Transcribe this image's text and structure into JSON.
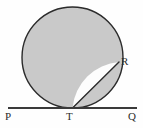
{
  "figure": {
    "background_color": "#fefefe",
    "stroke_color": "#2b2b2b",
    "shaded_fill_color": "#c9c9c9",
    "unshaded_fill_color": "#fdfdfd",
    "labels": {
      "P": "P",
      "T": "T",
      "Q": "Q",
      "R": "R"
    }
  },
  "chart_data": {
    "type": "diagram",
    "elements": [
      {
        "name": "circle",
        "kind": "circle",
        "center_x": 72.5,
        "center_y": 57.5,
        "radius": 50.5,
        "fill": "#c9c9c9",
        "stroke": "#2b2b2b",
        "stroke_width": 1.4
      },
      {
        "name": "tangent-line-PQ",
        "kind": "line",
        "x1": 8,
        "y1": 108,
        "x2": 137,
        "y2": 108,
        "stroke": "#3a3a3a",
        "stroke_width": 2.2
      },
      {
        "name": "chord-TR",
        "kind": "line",
        "x1": 72.5,
        "y1": 108,
        "x2": 119,
        "y2": 62,
        "stroke": "#2b2b2b",
        "stroke_width": 1.4
      },
      {
        "name": "circular-segment-TR",
        "kind": "segment",
        "fill": "#fdfdfd",
        "description": "Unshaded region between chord TR and minor arc TR"
      }
    ],
    "points": [
      {
        "label": "P",
        "x": 10,
        "y": 108,
        "on": "tangent-line",
        "role": "left endpoint of tangent line"
      },
      {
        "label": "T",
        "x": 72.5,
        "y": 108,
        "on": "circle",
        "role": "point of tangency"
      },
      {
        "label": "Q",
        "x": 131,
        "y": 108,
        "on": "tangent-line",
        "role": "right endpoint of tangent line"
      },
      {
        "label": "R",
        "x": 119,
        "y": 62,
        "on": "circle",
        "role": "chord endpoint on circle"
      }
    ],
    "xlabel": "",
    "ylabel": "",
    "grid": false,
    "legend": null
  }
}
